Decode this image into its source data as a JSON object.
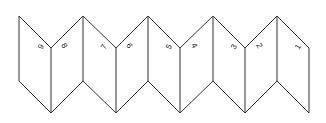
{
  "diagram": {
    "type": "accordion-fold",
    "panel_count": 9,
    "stroke_color": "#333333",
    "background": "#ffffff",
    "labels": [
      {
        "text": "9",
        "x": 42,
        "y": 50,
        "rotate": -60
      },
      {
        "text": "8",
        "x": 61,
        "y": 45,
        "rotate": 60
      },
      {
        "text": "7",
        "x": 105,
        "y": 50,
        "rotate": -60
      },
      {
        "text": "6",
        "x": 126,
        "y": 45,
        "rotate": 60
      },
      {
        "text": "5",
        "x": 170,
        "y": 50,
        "rotate": -60
      },
      {
        "text": "4",
        "x": 191,
        "y": 45,
        "rotate": 60
      },
      {
        "text": "3",
        "x": 235,
        "y": 50,
        "rotate": -60
      },
      {
        "text": "2",
        "x": 256,
        "y": 45,
        "rotate": 60
      },
      {
        "text": "1",
        "x": 299,
        "y": 50,
        "rotate": -60
      }
    ]
  }
}
